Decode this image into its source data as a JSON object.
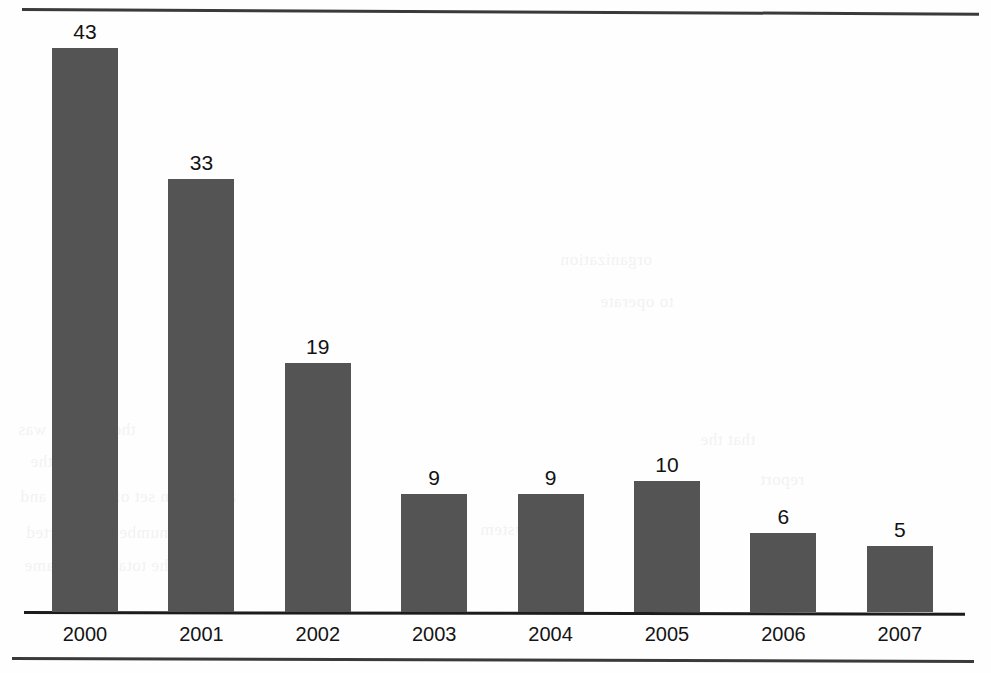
{
  "chart_data": {
    "type": "bar",
    "title": "",
    "subtitle": "",
    "xlabel": "",
    "ylabel": "",
    "categories": [
      "2000",
      "2001",
      "2002",
      "2003",
      "2004",
      "2005",
      "2006",
      "2007"
    ],
    "values": [
      43,
      33,
      19,
      9,
      9,
      10,
      6,
      5
    ],
    "value_labels": [
      "43",
      "33",
      "19",
      "9",
      "9",
      "10",
      "6",
      "5"
    ],
    "ylim": [
      0,
      46
    ],
    "grid": false,
    "legend": false,
    "legend_position": "none",
    "axis": {
      "y_axis_visible": false,
      "y_tick_labels": [],
      "x_axis_visible": true,
      "x_tick_labels": [
        "2000",
        "2001",
        "2002",
        "2003",
        "2004",
        "2005",
        "2006",
        "2007"
      ]
    },
    "annotations": [],
    "colors": {
      "bar_fill": "#545454",
      "baseline": "#1c1c1c",
      "value_label": "#121212",
      "tick_label": "#141414",
      "page_background": "#fefefe",
      "rule": "#3a3a3a"
    }
  },
  "page": {
    "rule_top_name": "page-rule-top",
    "rule_bottom_name": "page-rule-bottom"
  },
  "ghost_text": [
    {
      "text": "of the",
      "x": 170,
      "y": 244,
      "size": 18
    },
    {
      "text": "the concept was",
      "x": 18,
      "y": 420,
      "size": 17
    },
    {
      "text": "in in the",
      "x": 30,
      "y": 452,
      "size": 17
    },
    {
      "text": "a common set of systems and",
      "x": 20,
      "y": 487,
      "size": 17
    },
    {
      "text": "with the number of reported",
      "x": 26,
      "y": 523,
      "size": 17
    },
    {
      "text": "and the total in the same",
      "x": 24,
      "y": 556,
      "size": 17
    },
    {
      "text": "organization",
      "x": 560,
      "y": 250,
      "size": 17
    },
    {
      "text": "to operate",
      "x": 600,
      "y": 292,
      "size": 17
    },
    {
      "text": "that the",
      "x": 700,
      "y": 430,
      "size": 17
    },
    {
      "text": "report",
      "x": 760,
      "y": 470,
      "size": 17
    },
    {
      "text": "system",
      "x": 480,
      "y": 520,
      "size": 17
    },
    {
      "text": "period",
      "x": 640,
      "y": 556,
      "size": 17
    }
  ]
}
